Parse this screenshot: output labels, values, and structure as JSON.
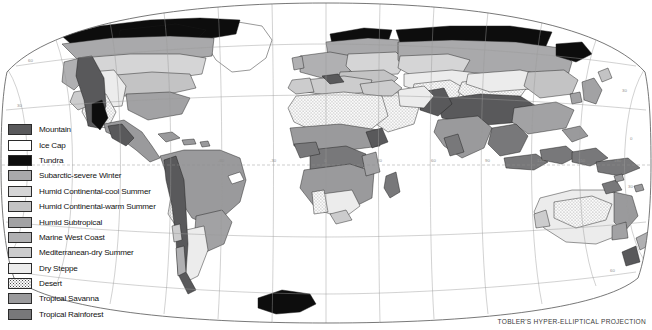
{
  "figure": {
    "kind": "thematic-world-map",
    "projection_credit": "TOBLER'S HYPER-ELLIPTICAL PROJECTION",
    "background_color": "#ffffff",
    "frame_color": "#555555",
    "graticule_color": "#9a9a9a",
    "equator_color": "#8f8f8f",
    "coastline_color": "#1a1a1a"
  },
  "legend": {
    "items": [
      {
        "label": "Mountain",
        "color": "#59595b",
        "pattern": "solid"
      },
      {
        "label": "Ice Cap",
        "color": "#ffffff",
        "pattern": "solid"
      },
      {
        "label": "Tundra",
        "color": "#0d0d0d",
        "pattern": "solid"
      },
      {
        "label": "Subarctic-severe Winter",
        "color": "#a9a9ab",
        "pattern": "solid"
      },
      {
        "label": "Humid Continental-cool Summer",
        "color": "#d5d5d6",
        "pattern": "solid"
      },
      {
        "label": "Humid Continental-warm Summer",
        "color": "#c3c3c4",
        "pattern": "solid"
      },
      {
        "label": "Humid Subtropical",
        "color": "#a2a2a4",
        "pattern": "solid"
      },
      {
        "label": "Marine West Coast",
        "color": "#b0b0b2",
        "pattern": "solid"
      },
      {
        "label": "Mediterranean-dry Summer",
        "color": "#cccccd",
        "pattern": "solid"
      },
      {
        "label": "Dry Steppe",
        "color": "#ececec",
        "pattern": "solid"
      },
      {
        "label": "Desert",
        "color": "#fbfbfb",
        "pattern": "stipple"
      },
      {
        "label": "Tropical Savanna",
        "color": "#9a9a9c",
        "pattern": "solid"
      },
      {
        "label": "Tropical Rainforest",
        "color": "#78787a",
        "pattern": "solid"
      }
    ]
  },
  "graticule": {
    "longitude_labels": [
      "-150",
      "-120",
      "-90",
      "-60",
      "-30",
      "0",
      "30",
      "60",
      "90",
      "120",
      "150",
      "180"
    ],
    "latitude_labels": [
      "60",
      "30",
      "0",
      "30",
      "60"
    ],
    "longitude_interval_deg": 30,
    "latitude_interval_deg": 30
  }
}
